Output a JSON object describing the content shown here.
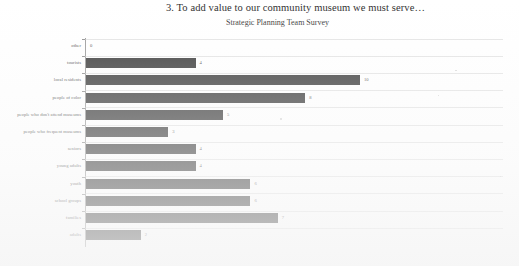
{
  "chart_data": {
    "type": "bar",
    "orientation": "horizontal",
    "title": "3. To add value to our community museum we must serve…",
    "subtitle": "Strategic Planning Team Survey",
    "xlabel": "",
    "ylabel": "",
    "xlim": [
      0,
      15
    ],
    "grid": true,
    "legend": "none",
    "axis_origin_label": "0",
    "categories": [
      "other",
      "tourists",
      "local residents",
      "people of color",
      "people who don't attend museums",
      "people who frequent museums",
      "seniors",
      "young adults",
      "youth",
      "school groups",
      "families",
      "adults"
    ],
    "values": [
      0,
      4,
      10,
      8,
      5,
      3,
      4,
      4,
      6,
      6,
      7,
      2
    ],
    "value_labels": [
      "0",
      "4",
      "10",
      "8",
      "5",
      "3",
      "4",
      "4",
      "6",
      "6",
      "7",
      "2"
    ],
    "bar_color": "#3c3c3c"
  }
}
